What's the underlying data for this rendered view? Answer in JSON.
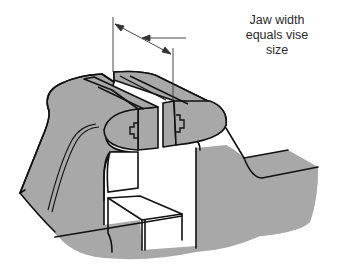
{
  "figure": {
    "annotation": {
      "lines": [
        "Jaw width",
        "equals vise",
        "size"
      ]
    },
    "colors": {
      "body_fill": "#a8a8a8",
      "outline": "#111111",
      "background": "#ffffff",
      "text": "#2a2a2a"
    }
  }
}
